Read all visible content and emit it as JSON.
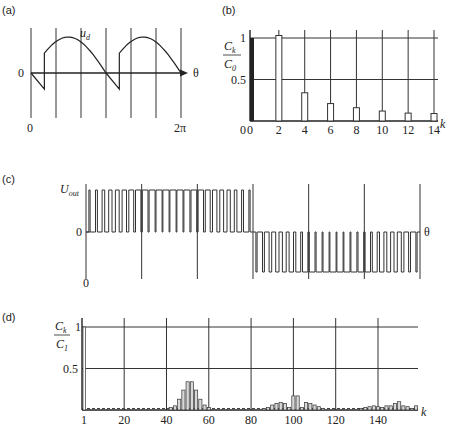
{
  "chart_data": [
    {
      "id": "a",
      "panel_label": "(a)",
      "type": "line",
      "title": "",
      "xlabel": "θ",
      "ylabel": "",
      "curve_label": "u_d",
      "curve_label_main": "u",
      "curve_label_sub": "d",
      "x_tick_labels": [
        "0",
        "2π"
      ],
      "y_tick_labels": [
        "0"
      ],
      "xlim": [
        0,
        6.2832
      ],
      "ylim": [
        -0.5,
        1
      ],
      "grid": "vertical",
      "grid_divisions": 6,
      "description": "Rectified output voltage: two identical arc segments per period, each starting with a negative sawtooth dip then jumping to a positive arc.",
      "segments": [
        {
          "x_start": 0,
          "x_dip": 0.56,
          "dip_value": -0.45,
          "jump_value": 0.55,
          "peak_x": 1.72,
          "peak_value": 1.0,
          "x_end": 3.1416
        },
        {
          "x_start": 3.1416,
          "x_dip": 3.7,
          "dip_value": -0.45,
          "jump_value": 0.55,
          "peak_x": 4.86,
          "peak_value": 1.0,
          "x_end": 6.2832
        }
      ]
    },
    {
      "id": "b",
      "panel_label": "(b)",
      "type": "bar",
      "title": "",
      "xlabel": "k",
      "ylabel_num": "C",
      "ylabel_num_sub": "k",
      "ylabel_den": "C",
      "ylabel_den_sub": "0",
      "categories": [
        0,
        2,
        4,
        6,
        8,
        10,
        12,
        14
      ],
      "x_tick_labels": [
        "0",
        "2",
        "4",
        "6",
        "8",
        "10",
        "12",
        "14"
      ],
      "y_tick_labels": [
        "0",
        "0.5",
        "1"
      ],
      "values": [
        1.0,
        1.03,
        0.34,
        0.21,
        0.16,
        0.12,
        0.095,
        0.09
      ],
      "ylim": [
        0,
        1.1
      ],
      "xlim": [
        0,
        14.5
      ],
      "grid": true,
      "first_bar_filled": true
    },
    {
      "id": "c",
      "panel_label": "(c)",
      "type": "line",
      "title": "",
      "xlabel": "θ",
      "ylabel": "U_out",
      "ylabel_main": "U",
      "ylabel_sub": "out",
      "x_tick_labels": [
        "0"
      ],
      "y_tick_labels": [
        "0"
      ],
      "levels": [
        1,
        0,
        -1
      ],
      "grid": "vertical",
      "grid_divisions": 6,
      "description": "Unipolar PWM output: positive pulses during first half-period, negative pulses during second half; pulse widths vary sinusoidally (narrow near zero crossings, wide near peaks).",
      "pulses_per_half_period": 24,
      "pulse_width_min": 0.12,
      "pulse_width_max": 0.9
    },
    {
      "id": "d",
      "panel_label": "(d)",
      "type": "bar",
      "title": "",
      "xlabel": "k",
      "ylabel_num": "C",
      "ylabel_num_sub": "k",
      "ylabel_den": "C",
      "ylabel_den_sub": "1",
      "x_tick_labels": [
        "1",
        "20",
        "40",
        "60",
        "80",
        "100",
        "120",
        "140"
      ],
      "x_ticks": [
        1,
        20,
        40,
        60,
        80,
        100,
        120,
        140
      ],
      "y_tick_labels": [
        "0.5",
        "1"
      ],
      "y_ticks": [
        0.5,
        1
      ],
      "xlim": [
        1,
        158
      ],
      "ylim": [
        0,
        1
      ],
      "grid": true,
      "baseline_level": 0.01,
      "bars": [
        {
          "k": 1,
          "v": 1.0
        },
        {
          "k": 42,
          "v": 0.03
        },
        {
          "k": 44,
          "v": 0.05
        },
        {
          "k": 46,
          "v": 0.13
        },
        {
          "k": 48,
          "v": 0.24
        },
        {
          "k": 50,
          "v": 0.34
        },
        {
          "k": 52,
          "v": 0.34
        },
        {
          "k": 54,
          "v": 0.24
        },
        {
          "k": 56,
          "v": 0.13
        },
        {
          "k": 58,
          "v": 0.06
        },
        {
          "k": 60,
          "v": 0.03
        },
        {
          "k": 86,
          "v": 0.02
        },
        {
          "k": 88,
          "v": 0.03
        },
        {
          "k": 90,
          "v": 0.06
        },
        {
          "k": 92,
          "v": 0.08
        },
        {
          "k": 94,
          "v": 0.09
        },
        {
          "k": 96,
          "v": 0.08
        },
        {
          "k": 98,
          "v": 0.03
        },
        {
          "k": 100,
          "v": 0.17
        },
        {
          "k": 102,
          "v": 0.17
        },
        {
          "k": 104,
          "v": 0.03
        },
        {
          "k": 106,
          "v": 0.09
        },
        {
          "k": 108,
          "v": 0.08
        },
        {
          "k": 110,
          "v": 0.06
        },
        {
          "k": 112,
          "v": 0.04
        },
        {
          "k": 114,
          "v": 0.02
        },
        {
          "k": 132,
          "v": 0.02
        },
        {
          "k": 134,
          "v": 0.03
        },
        {
          "k": 136,
          "v": 0.04
        },
        {
          "k": 138,
          "v": 0.05
        },
        {
          "k": 140,
          "v": 0.04
        },
        {
          "k": 142,
          "v": 0.03
        },
        {
          "k": 144,
          "v": 0.05
        },
        {
          "k": 146,
          "v": 0.05
        },
        {
          "k": 148,
          "v": 0.08
        },
        {
          "k": 150,
          "v": 0.1
        },
        {
          "k": 152,
          "v": 0.05
        },
        {
          "k": 154,
          "v": 0.04
        },
        {
          "k": 156,
          "v": 0.02
        },
        {
          "k": 158,
          "v": 0.05
        }
      ]
    }
  ]
}
